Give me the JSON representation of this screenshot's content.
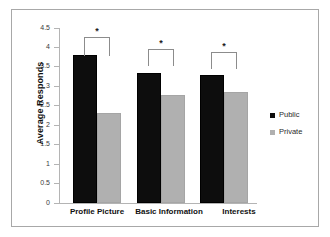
{
  "chart_data": {
    "type": "bar",
    "title": "",
    "xlabel": "",
    "ylabel": "Average Responds",
    "ylim": [
      0,
      4.5
    ],
    "ytick_labels": [
      "0",
      "0.5",
      "1",
      "1.5",
      "2",
      "2.5",
      "3",
      "3.5",
      "4",
      "4.5"
    ],
    "ytick_values": [
      0,
      0.5,
      1,
      1.5,
      2,
      2.5,
      3,
      3.5,
      4,
      4.5
    ],
    "grid": false,
    "legend_position": "right",
    "categories": [
      "Profile Picture",
      "Basic Information",
      "Interests"
    ],
    "series": [
      {
        "name": "Public",
        "color": "#0d0d0d",
        "values": [
          3.8,
          3.35,
          3.28
        ]
      },
      {
        "name": "Private",
        "color": "#b0b0b0",
        "values": [
          2.31,
          2.78,
          2.85
        ]
      }
    ],
    "annotations": [
      {
        "label": "*",
        "category": "Profile Picture"
      },
      {
        "label": "*",
        "category": "Basic Information"
      },
      {
        "label": "*",
        "category": "Interests"
      }
    ]
  },
  "legend": {
    "items": [
      {
        "label": "Public"
      },
      {
        "label": "Private"
      }
    ]
  },
  "axis": {
    "y_title": "Average Responds",
    "y_labels": {
      "t0": "0",
      "t1": "0.5",
      "t2": "1",
      "t3": "1.5",
      "t4": "2",
      "t5": "2.5",
      "t6": "3",
      "t7": "3.5",
      "t8": "4",
      "t9": "4.5"
    }
  },
  "groups": {
    "g0": "Profile Picture",
    "g1": "Basic Information",
    "g2": "Interests"
  },
  "significance": {
    "s0": "*",
    "s1": "*",
    "s2": "*"
  },
  "colors": {
    "public": "#0d0d0d",
    "private": "#b0b0b0",
    "frame": "#a8a8a8",
    "axis": "#b4b4b4"
  }
}
